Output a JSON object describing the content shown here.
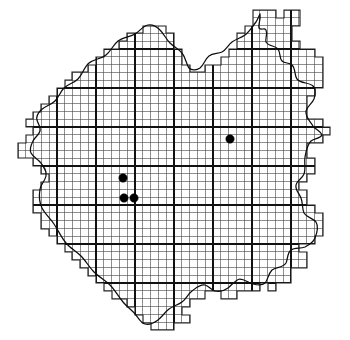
{
  "figure": {
    "type": "distribution-grid-map",
    "width": 350,
    "height": 340,
    "background_color": "#ffffff"
  },
  "chart_data": {
    "type": "map",
    "subtitle": "",
    "xlabel": "",
    "ylabel": "",
    "grid": true,
    "legend": "none",
    "grid_spec": {
      "minor_spacing_px": 7.8,
      "major_every_n_cells": 5,
      "minor_color": "#4a4a4a",
      "major_color": "#111111",
      "origin_x_px": 18.0,
      "origin_y_px": 10.0
    },
    "major_gridlines": {
      "vertical_x_px": [
        57,
        96,
        135,
        174,
        213,
        252,
        291
      ],
      "horizontal_y_px": [
        49,
        88,
        127,
        166,
        205,
        244,
        283
      ]
    },
    "records": [
      {
        "id": "record-1",
        "x_px": 230,
        "y_px": 139,
        "radius_px": 4.2,
        "color": "#000000"
      },
      {
        "id": "record-2",
        "x_px": 123,
        "y_px": 178,
        "radius_px": 4.2,
        "color": "#000000"
      },
      {
        "id": "record-3",
        "x_px": 124,
        "y_px": 198,
        "radius_px": 4.2,
        "color": "#000000"
      },
      {
        "id": "record-4",
        "x_px": 134,
        "y_px": 198,
        "radius_px": 4.2,
        "color": "#000000"
      }
    ],
    "record_count": 4,
    "region_extent_px": {
      "x_min": 18,
      "x_max": 330,
      "y_min": 10,
      "y_max": 330
    }
  },
  "geometry": {
    "cell_outline_path": "M 253 10 L 276 10 L 276 18 L 284 18 L 284 10 L 300 10 L 300 26 L 292 26 L 292 41 L 300 41 L 300 49 L 315 49 L 315 57 L 323 57 L 323 88 L 315 88 L 315 96 L 307 96 L 307 119 L 323 119 L 323 127 L 330 127 L 330 135 L 323 135 L 323 143 L 307 143 L 307 158 L 315 158 L 315 174 L 307 174 L 307 182 L 299 182 L 299 190 L 307 190 L 307 205 L 315 205 L 315 213 L 323 213 L 323 236 L 315 236 L 315 244 L 299 244 L 299 252 L 307 252 L 307 268 L 291 268 L 291 283 L 276 283 L 276 291 L 268 291 L 268 283 L 260 283 L 260 291 L 237 291 L 237 299 L 221 299 L 221 291 L 205 291 L 205 299 L 190 299 L 190 307 L 182 307 L 182 315 L 190 315 L 190 323 L 174 323 L 174 330 L 151 330 L 151 323 L 143 323 L 143 315 L 135 315 L 135 307 L 127 307 L 127 299 L 112 299 L 112 291 L 104 291 L 104 283 L 96 283 L 96 276 L 88 276 L 88 268 L 80 268 L 80 260 L 72 260 L 72 252 L 65 252 L 65 244 L 57 244 L 57 236 L 49 236 L 49 229 L 41 229 L 41 213 L 33 213 L 33 190 L 41 190 L 41 182 L 49 182 L 49 174 L 41 174 L 41 166 L 33 166 L 33 158 L 18 158 L 18 143 L 26 143 L 26 135 L 33 135 L 33 127 L 26 127 L 26 119 L 33 119 L 33 112 L 41 112 L 41 104 L 49 104 L 49 96 L 57 96 L 57 88 L 65 88 L 65 80 L 72 80 L 72 72 L 88 72 L 88 65 L 96 65 L 96 57 L 104 57 L 104 49 L 119 49 L 119 41 L 127 41 L 127 33 L 143 33 L 143 26 L 166 26 L 166 33 L 174 33 L 174 49 L 182 49 L 182 65 L 190 65 L 190 72 L 205 72 L 205 65 L 221 65 L 221 57 L 229 57 L 229 49 L 237 49 L 237 33 L 245 33 L 245 26 L 253 26 Z",
    "boundary_path": "M 260 14 C 261 20 258 24 259 28 C 262 31 264 27 266 30 C 268 34 265 38 266 42 C 269 47 275 45 278 49 C 281 53 279 58 282 61 C 285 64 289 62 292 65 C 296 69 294 75 297 79 C 301 84 309 82 313 86 C 317 90 315 95 314 99 C 312 104 307 106 306 111 C 305 117 310 121 313 126 C 316 130 321 131 322 135 C 320 139 315 138 311 141 C 307 145 306 151 305 157 C 304 163 306 169 304 174 C 302 179 297 180 296 185 C 295 190 299 193 301 198 C 303 203 302 209 304 213 C 307 218 313 218 316 222 C 319 227 317 233 315 238 C 313 243 309 245 305 247 C 300 249 295 247 291 250 C 287 253 288 259 286 263 C 283 268 276 267 272 270 C 268 274 268 280 265 283 C 262 286 257 285 253 284 C 248 283 245 279 240 279 C 235 280 232 285 228 288 C 224 291 219 292 215 291 C 211 290 209 286 205 285 C 200 284 196 288 192 291 C 188 294 186 299 182 302 C 178 305 173 306 169 309 C 165 312 162 317 158 320 C 154 323 149 325 145 324 C 141 323 139 319 136 315 C 132 310 127 307 123 302 C 118 296 115 290 110 285 C 105 280 99 277 94 272 C 89 267 86 261 81 256 C 76 251 70 248 66 243 C 61 237 58 230 54 224 C 50 218 45 214 42 208 C 39 202 39 195 40 189 C 41 184 45 181 46 176 C 47 171 44 167 41 163 C 38 159 33 157 31 153 C 29 149 31 145 33 141 C 35 137 39 135 40 131 C 41 127 38 124 37 120 C 36 116 38 113 41 110 C 45 106 51 105 55 101 C 59 97 60 92 64 88 C 68 84 74 83 78 79 C 83 74 84 67 89 63 C 94 59 101 59 106 55 C 111 51 113 45 118 41 C 123 37 130 37 135 34 C 140 31 143 26 148 25 C 153 24 157 27 160 30 C 164 34 166 39 170 43 C 174 47 179 49 182 53 C 186 58 186 64 189 68 C 192 71 197 70 200 68 C 204 65 205 59 209 56 C 213 53 218 54 222 52 C 226 50 228 45 232 42 C 236 39 241 38 245 35 C 249 32 252 27 256 22 C 258 19 259 16 260 14"
  },
  "annotations": []
}
